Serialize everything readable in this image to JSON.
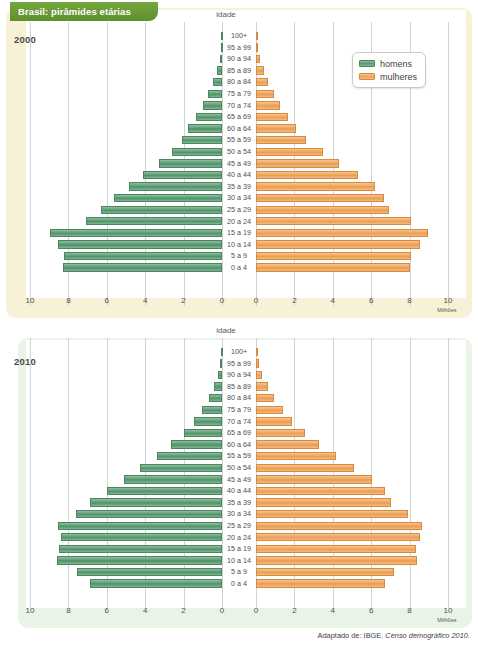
{
  "title": "Brasil: pirâmides etárias",
  "credit_vertical": "Gráficos: Cassiano Röda/Arquivo da editora",
  "source_prefix": "Adaptado de: IBGE. ",
  "source_italic": "Censo demográfico 2010.",
  "legend": {
    "men": "homens",
    "women": "mulheres"
  },
  "colors": {
    "men": "#5d9b74",
    "women": "#eea55d",
    "banner": "#76a63d",
    "panel_2000": "#f7f2d6",
    "panel_2010": "#e9f4e6"
  },
  "charts": [
    {
      "year": "2000",
      "axis_title": "idade",
      "unit_label": "Milhões"
    },
    {
      "year": "2010",
      "axis_title": "idade",
      "unit_label": "Milhões"
    }
  ],
  "age_groups": [
    "100+",
    "95 a 99",
    "90 a 94",
    "85 a 89",
    "80 a 84",
    "75 a 79",
    "70 a 74",
    "65 a 69",
    "60 a 64",
    "55 a 59",
    "50 a 54",
    "45 a 49",
    "40 a 44",
    "35 a 39",
    "30 a 34",
    "25 a 29",
    "20 a 24",
    "15 a 19",
    "10 a 14",
    "5 a 9",
    "0 a 4"
  ],
  "x_ticks_left": [
    "10",
    "8",
    "6",
    "4",
    "2",
    "0"
  ],
  "x_ticks_right": [
    "0",
    "2",
    "4",
    "6",
    "8",
    "10"
  ],
  "chart_data": [
    {
      "type": "bar",
      "title": "Brasil: pirâmides etárias — 2000",
      "subtitle": "2000",
      "orientation": "horizontal-diverging",
      "xlabel": "Milhões",
      "ylabel": "idade",
      "xlim": [
        0,
        10
      ],
      "grid": true,
      "legend_position": "top-right",
      "categories": [
        "100+",
        "95 a 99",
        "90 a 94",
        "85 a 89",
        "80 a 84",
        "75 a 79",
        "70 a 74",
        "65 a 69",
        "60 a 64",
        "55 a 59",
        "50 a 54",
        "45 a 49",
        "40 a 44",
        "35 a 39",
        "30 a 34",
        "25 a 29",
        "20 a 24",
        "15 a 19",
        "10 a 14",
        "5 a 9",
        "0 a 4"
      ],
      "series": [
        {
          "name": "homens",
          "values": [
            0.01,
            0.06,
            0.13,
            0.28,
            0.45,
            0.72,
            1.0,
            1.35,
            1.75,
            2.1,
            2.6,
            3.3,
            4.1,
            4.85,
            5.65,
            6.3,
            7.1,
            8.95,
            8.55,
            8.25,
            8.3
          ]
        },
        {
          "name": "mulheres",
          "values": [
            0.02,
            0.09,
            0.2,
            0.4,
            0.62,
            0.95,
            1.25,
            1.65,
            2.1,
            2.6,
            3.5,
            4.3,
            5.3,
            6.2,
            6.65,
            6.95,
            8.05,
            8.95,
            8.55,
            8.05,
            8.0
          ]
        }
      ]
    },
    {
      "type": "bar",
      "title": "Brasil: pirâmides etárias — 2010",
      "subtitle": "2010",
      "orientation": "horizontal-diverging",
      "xlabel": "Milhões",
      "ylabel": "idade",
      "xlim": [
        0,
        10
      ],
      "grid": true,
      "legend_position": "top-right",
      "categories": [
        "100+",
        "95 a 99",
        "90 a 94",
        "85 a 89",
        "80 a 84",
        "75 a 79",
        "70 a 74",
        "65 a 69",
        "60 a 64",
        "55 a 59",
        "50 a 54",
        "45 a 49",
        "40 a 44",
        "35 a 39",
        "30 a 34",
        "25 a 29",
        "20 a 24",
        "15 a 19",
        "10 a 14",
        "5 a 9",
        "0 a 4"
      ],
      "series": [
        {
          "name": "homens",
          "values": [
            0.02,
            0.09,
            0.2,
            0.42,
            0.7,
            1.05,
            1.45,
            2.0,
            2.65,
            3.4,
            4.25,
            5.1,
            6.0,
            6.85,
            7.6,
            8.55,
            8.4,
            8.5,
            8.6,
            7.55,
            6.9
          ]
        },
        {
          "name": "mulheres",
          "values": [
            0.03,
            0.14,
            0.32,
            0.62,
            0.95,
            1.4,
            1.9,
            2.55,
            3.3,
            4.15,
            5.1,
            6.05,
            6.7,
            7.05,
            7.9,
            8.65,
            8.55,
            8.35,
            8.4,
            7.2,
            6.7
          ]
        }
      ]
    }
  ]
}
